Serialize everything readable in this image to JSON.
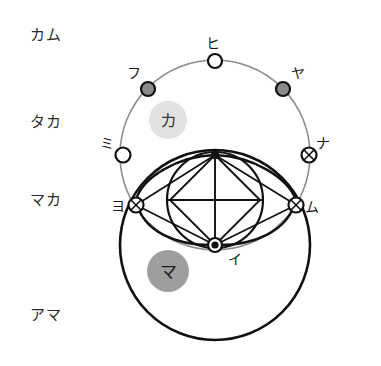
{
  "diagram": {
    "levels": [
      {
        "id": "kamu",
        "label": "カム",
        "x": 30,
        "y": 40
      },
      {
        "id": "taka",
        "label": "タカ",
        "x": 30,
        "y": 127
      },
      {
        "id": "maka",
        "label": "マカ",
        "x": 30,
        "y": 205
      },
      {
        "id": "ama",
        "label": "アマ",
        "x": 30,
        "y": 320
      }
    ],
    "badges": [
      {
        "id": "ka",
        "label": "カ",
        "cx": 168,
        "cy": 120,
        "r": 19,
        "color": "#e2e2e2"
      },
      {
        "id": "ma",
        "label": "マ",
        "cx": 168,
        "cy": 271,
        "r": 21,
        "color": "#9e9e9e"
      }
    ],
    "nodes": [
      {
        "id": "hi",
        "label": "ヒ",
        "cx": 215,
        "cy": 61,
        "style": "hollow",
        "label_x": 206,
        "label_y": 48
      },
      {
        "id": "fu",
        "label": "フ",
        "cx": 148,
        "cy": 89,
        "style": "filled-gray",
        "label_x": 128,
        "label_y": 78
      },
      {
        "id": "ya",
        "label": "ヤ",
        "cx": 283,
        "cy": 89,
        "style": "filled-gray",
        "label_x": 291,
        "label_y": 78
      },
      {
        "id": "mi",
        "label": "ミ",
        "cx": 123,
        "cy": 155,
        "style": "hollow",
        "label_x": 101,
        "label_y": 147
      },
      {
        "id": "na",
        "label": "ナ",
        "cx": 309,
        "cy": 155,
        "style": "cross",
        "label_x": 316,
        "label_y": 147
      },
      {
        "id": "yo",
        "label": "ヨ",
        "cx": 136,
        "cy": 205,
        "style": "cross",
        "label_x": 112,
        "label_y": 210
      },
      {
        "id": "mu",
        "label": "ム",
        "cx": 296,
        "cy": 205,
        "style": "cross",
        "label_x": 306,
        "label_y": 211
      },
      {
        "id": "i",
        "label": "イ",
        "cx": 215,
        "cy": 245,
        "style": "solid",
        "label_x": 228,
        "label_y": 263
      }
    ],
    "horizontal_lines": [
      {
        "id": "line-kamu-taka",
        "y": 89,
        "x1": 22,
        "x2": 360
      },
      {
        "id": "line-taka-maka",
        "y": 155,
        "x1": 22,
        "x2": 360
      },
      {
        "id": "line-maka-ama",
        "y": 245,
        "x1": 22,
        "x2": 360
      }
    ],
    "circles": [
      {
        "id": "upper-circle",
        "cx": 215,
        "cy": 155,
        "r": 95,
        "stroke": "#8d8d8d",
        "width": 1.6
      },
      {
        "id": "lower-circle",
        "cx": 215,
        "cy": 245,
        "r": 95,
        "stroke": "#111111",
        "width": 2.6
      },
      {
        "id": "inner-circle",
        "cx": 215,
        "cy": 200,
        "r": 48,
        "stroke": "#111111",
        "width": 2.2
      }
    ],
    "vesica": {
      "id": "vesica-lens",
      "top_y": 155,
      "bottom_y": 245,
      "left_x": 136,
      "right_x": 296
    },
    "colors": {
      "background": "#ffffff",
      "ink": "#111111",
      "gray_stroke": "#8d8d8d",
      "badge_light": "#e2e2e2",
      "badge_dark": "#9e9e9e",
      "text": "#2b2b2b"
    }
  }
}
